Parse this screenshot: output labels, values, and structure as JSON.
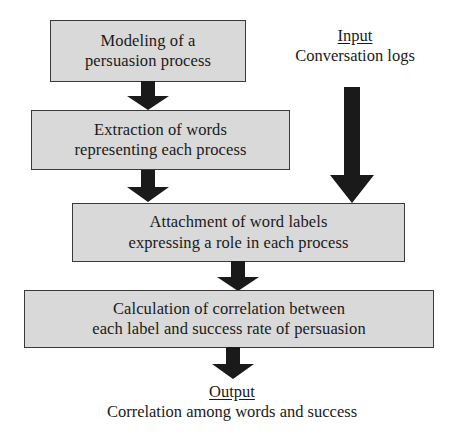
{
  "diagram": {
    "background_color": "#ffffff",
    "box_fill_color": "#d9d9d9",
    "box_border_color": "#3a3a3a",
    "arrow_color": "#1a1a1a",
    "text_color": "#1a1a1a"
  },
  "boxes": [
    {
      "id": "modeling",
      "text": "Modeling of a\npersuasion process"
    },
    {
      "id": "extraction",
      "text": "Extraction of words\nrepresenting each process"
    },
    {
      "id": "attachment",
      "text": "Attachment of word labels\nexpressing a role in each process"
    },
    {
      "id": "calculation",
      "text": "Calculation of correlation between\neach label and success rate of persuasion"
    }
  ],
  "input": {
    "title": "Input",
    "subtitle": "Conversation logs"
  },
  "output": {
    "title": "Output",
    "subtitle": "Correlation among words and success"
  },
  "arrows": [
    {
      "id": "modeling-to-extraction",
      "direction": "down"
    },
    {
      "id": "extraction-to-attachment",
      "direction": "down"
    },
    {
      "id": "attachment-to-calculation",
      "direction": "down"
    },
    {
      "id": "calculation-to-output",
      "direction": "down"
    },
    {
      "id": "input-to-attachment",
      "direction": "down"
    }
  ]
}
